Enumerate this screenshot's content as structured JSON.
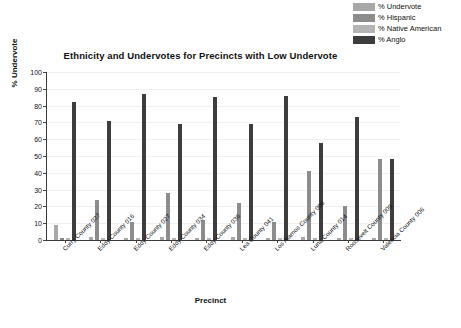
{
  "chart_data": {
    "type": "bar",
    "title": "Ethnicity and Undervotes for Precincts with Low Undervote",
    "xlabel": "Precinct",
    "ylabel": "% Undervote",
    "ylim": [
      0,
      100
    ],
    "ytick_step": 10,
    "grid": true,
    "legend_position": "top-right",
    "categories": [
      "Curry County 037",
      "Eddy County 016",
      "Eddy County 027",
      "Eddy County 034",
      "Eddy County 036",
      "Lea County 041",
      "Los Alamos County 006",
      "Luna County 014",
      "Roosevelt County 009",
      "Valencia County 006"
    ],
    "series": [
      {
        "name": "% Undervote",
        "color": "#a8a8a8",
        "values": [
          9,
          2,
          1,
          2,
          1,
          2,
          1,
          2,
          1,
          1
        ]
      },
      {
        "name": "% Hispanic",
        "color": "#8c8c8c",
        "values": [
          1,
          24,
          11,
          28,
          12,
          22,
          11,
          41,
          20,
          48
        ]
      },
      {
        "name": "% Native American",
        "color": "#b4b4b4",
        "values": [
          1,
          1,
          1,
          1,
          1,
          1,
          1,
          1,
          1,
          1
        ]
      },
      {
        "name": "% Anglo",
        "color": "#3d3d3d",
        "values": [
          82,
          71,
          87,
          69,
          85,
          69,
          86,
          58,
          73,
          48
        ]
      }
    ],
    "ytick_labels": [
      "0",
      "10",
      "20",
      "30",
      "40",
      "50",
      "60",
      "70",
      "80",
      "90",
      "100"
    ]
  },
  "legend": {
    "items": [
      {
        "label": "% Undervote",
        "color": "#a8a8a8"
      },
      {
        "label": "% Hispanic",
        "color": "#8c8c8c"
      },
      {
        "label": "% Native American",
        "color": "#b4b4b4"
      },
      {
        "label": "% Anglo",
        "color": "#3d3d3d"
      }
    ]
  },
  "caption": ""
}
